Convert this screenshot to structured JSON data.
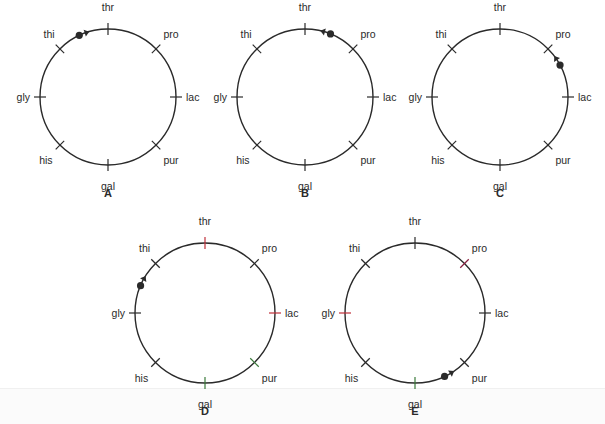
{
  "figure": {
    "genes": [
      "thr",
      "pro",
      "lac",
      "pur",
      "gal",
      "his",
      "gly",
      "thi"
    ],
    "gene_angles_deg": {
      "thr": 0,
      "pro": 45,
      "lac": 90,
      "pur": 135,
      "gal": 180,
      "his": 225,
      "gly": 270,
      "thi": 315
    },
    "colors": {
      "ink": "#2a2a2a",
      "red": "#c0303a",
      "green": "#3a7a3a",
      "magenta": "#8a2040"
    }
  },
  "panels": [
    {
      "id": "A",
      "label": "A",
      "cx": 108,
      "cy": 97,
      "r": 68,
      "origin_angle_deg": 335,
      "arrow_direction": "clockwise",
      "arrow_toward": "thr",
      "tick_colors": {},
      "label_colors": {},
      "arc_color": "#2a2a2a"
    },
    {
      "id": "B",
      "label": "B",
      "cx": 305,
      "cy": 97,
      "r": 68,
      "origin_angle_deg": 22,
      "arrow_direction": "counterclockwise",
      "arrow_toward": "thr",
      "tick_colors": {},
      "label_colors": {},
      "arc_color": "#2a2a2a"
    },
    {
      "id": "C",
      "label": "C",
      "cx": 500,
      "cy": 97,
      "r": 68,
      "origin_angle_deg": 62,
      "arrow_direction": "counterclockwise",
      "arrow_toward": "pro",
      "tick_colors": {},
      "label_colors": {},
      "arc_color": "#2a2a2a"
    },
    {
      "id": "D",
      "label": "D",
      "cx": 205,
      "cy": 313,
      "r": 70,
      "origin_angle_deg": 293,
      "arrow_direction": "clockwise",
      "arrow_toward": "thi",
      "tick_colors": {
        "thr": "#c0303a",
        "lac": "#c0303a",
        "gal": "#3a7a3a",
        "pur": "#3a7a3a"
      },
      "label_colors": {
        "gly": "#8a2040"
      },
      "arc_color": "#2a2a2a"
    },
    {
      "id": "E",
      "label": "E",
      "cx": 415,
      "cy": 313,
      "r": 70,
      "origin_angle_deg": 155,
      "arrow_direction": "counterclockwise",
      "arrow_toward": "pur",
      "tick_colors": {
        "gly": "#c0303a",
        "pro": "#8a2040",
        "gal": "#3a7a3a"
      },
      "label_colors": {
        "pro": "#8a2040",
        "thr": "#8a2040",
        "gly": "#3a7a3a"
      },
      "arc_color": "#2a2a2a"
    }
  ]
}
